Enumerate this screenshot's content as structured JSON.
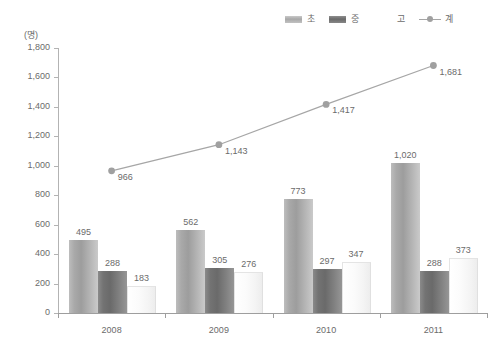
{
  "chart_data": {
    "type": "bar",
    "title": "",
    "xlabel": "",
    "ylabel": "(명)",
    "unit": "(명)",
    "categories": [
      "2008",
      "2009",
      "2010",
      "2011"
    ],
    "ylim": [
      0,
      1800
    ],
    "ytick_step": 200,
    "ytick_labels": [
      "1,800",
      "1,600",
      "1,400",
      "1,200",
      "1,000",
      "800",
      "600",
      "400",
      "200",
      "0"
    ],
    "ytick_values": [
      1800,
      1600,
      1400,
      1200,
      1000,
      800,
      600,
      400,
      200,
      0
    ],
    "grid": false,
    "legend_position": "top-right",
    "series": [
      {
        "name": "초",
        "type": "bar",
        "color": "#a9a9a9",
        "values": [
          495,
          562,
          773,
          1020
        ],
        "labels": [
          "495",
          "562",
          "773",
          "1,020"
        ]
      },
      {
        "name": "중",
        "type": "bar",
        "color": "#737373",
        "values": [
          288,
          305,
          297,
          288
        ],
        "labels": [
          "288",
          "305",
          "297",
          "288"
        ]
      },
      {
        "name": "고",
        "type": "bar",
        "color": "#ffffff",
        "values": [
          183,
          276,
          347,
          373
        ],
        "labels": [
          "183",
          "276",
          "347",
          "373"
        ]
      },
      {
        "name": "계",
        "type": "line",
        "color": "#a6a6a6",
        "values": [
          966,
          1143,
          1417,
          1681
        ],
        "labels": [
          "966",
          "1,143",
          "1,417",
          "1,681"
        ]
      }
    ]
  },
  "legend": {
    "items": [
      {
        "label": "초",
        "swatch": "bar-light"
      },
      {
        "label": "중",
        "swatch": "bar-dark"
      },
      {
        "label": "고",
        "swatch": "bar-white"
      },
      {
        "label": "계",
        "swatch": "line-marker"
      }
    ]
  }
}
